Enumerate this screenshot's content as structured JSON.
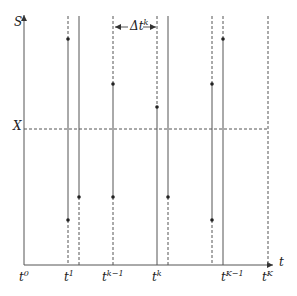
{
  "diagram": {
    "y_axis_label": "S",
    "x_axis_label": "t",
    "strike_label": "X",
    "delta_label": {
      "base": "Δt",
      "sup": "k"
    },
    "colors": {
      "line": "#555555",
      "dot": "#222222",
      "text": "#222222"
    },
    "ticks": [
      {
        "base": "t",
        "sup": "0"
      },
      {
        "base": "t",
        "sup": "1"
      },
      {
        "base": "t",
        "sup": "k−1"
      },
      {
        "base": "t",
        "sup": "k"
      },
      {
        "base": "t",
        "sup": "K−1"
      },
      {
        "base": "t",
        "sup": "K"
      }
    ]
  }
}
